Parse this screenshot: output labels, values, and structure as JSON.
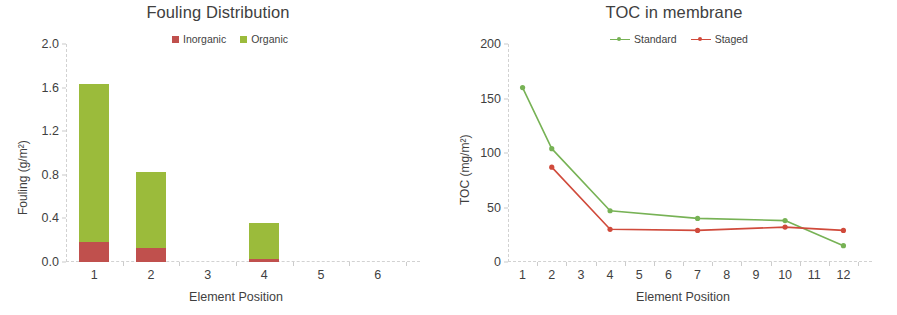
{
  "colors": {
    "inorganic": "#C0504D",
    "organic": "#9BBB3B",
    "standard": "#77B255",
    "staged": "#D04A3B",
    "axis": "#d2d2d2",
    "text": "#3f3f3f"
  },
  "charts": [
    {
      "id": "fouling-distribution",
      "chart_kind": "bar",
      "title": "Fouling Distribution",
      "legend": [
        {
          "label": "Inorganic",
          "color_key": "inorganic"
        },
        {
          "label": "Organic",
          "color_key": "organic"
        }
      ],
      "ylabel": "Fouling (g/m²)",
      "xlabel": "Element Position",
      "yticks": [
        "0.0",
        "0.4",
        "0.8",
        "1.2",
        "1.6",
        "2.0"
      ],
      "xticks": [
        "1",
        "2",
        "3",
        "4",
        "5",
        "6"
      ]
    },
    {
      "id": "toc-in-membrane",
      "chart_kind": "line",
      "title": "TOC in membrane",
      "legend": [
        {
          "label": "Standard",
          "color_key": "standard"
        },
        {
          "label": "Staged",
          "color_key": "staged"
        }
      ],
      "ylabel": "TOC (mg/m²)",
      "xlabel": "Element Position",
      "yticks": [
        "0",
        "50",
        "100",
        "150",
        "200"
      ],
      "xticks": [
        "1",
        "2",
        "3",
        "4",
        "5",
        "6",
        "7",
        "8",
        "9",
        "10",
        "11",
        "12"
      ]
    }
  ],
  "chart_data": [
    {
      "type": "bar",
      "title": "Fouling Distribution",
      "subtitle": "",
      "xlabel": "Element Position",
      "ylabel": "Fouling (g/m²)",
      "categories": [
        "1",
        "2",
        "3",
        "4",
        "5",
        "6"
      ],
      "stacked": true,
      "series": [
        {
          "name": "Inorganic",
          "color": "#C0504D",
          "values": [
            0.18,
            0.13,
            0,
            0.03,
            0,
            0
          ]
        },
        {
          "name": "Organic",
          "color": "#9BBB3B",
          "values": [
            1.45,
            0.7,
            0,
            0.33,
            0,
            0
          ]
        }
      ],
      "totals": [
        1.63,
        0.83,
        0,
        0.36,
        0,
        0
      ],
      "ylim": [
        0,
        2.0
      ],
      "ytick_values": [
        0.0,
        0.4,
        0.8,
        1.2,
        1.6,
        2.0
      ],
      "tick_labels": [
        "0.0",
        "0.4",
        "0.8",
        "1.2",
        "1.6",
        "2.0"
      ],
      "grid": false,
      "legend_position": "top-center"
    },
    {
      "type": "line",
      "title": "TOC in membrane",
      "subtitle": "",
      "xlabel": "Element Position",
      "ylabel": "TOC (mg/m²)",
      "x": [
        1,
        2,
        3,
        4,
        5,
        6,
        7,
        8,
        9,
        10,
        11,
        12
      ],
      "series": [
        {
          "name": "Standard",
          "color": "#77B255",
          "points": [
            {
              "x": 1,
              "y": 160
            },
            {
              "x": 2,
              "y": 104
            },
            {
              "x": 4,
              "y": 47
            },
            {
              "x": 7,
              "y": 40
            },
            {
              "x": 10,
              "y": 38
            },
            {
              "x": 12,
              "y": 15
            }
          ]
        },
        {
          "name": "Staged",
          "color": "#D04A3B",
          "points": [
            {
              "x": 2,
              "y": 87
            },
            {
              "x": 4,
              "y": 30
            },
            {
              "x": 7,
              "y": 29
            },
            {
              "x": 10,
              "y": 32
            },
            {
              "x": 12,
              "y": 29
            }
          ]
        }
      ],
      "ylim": [
        0,
        200
      ],
      "xlim": [
        1,
        12
      ],
      "ytick_values": [
        0,
        50,
        100,
        150,
        200
      ],
      "tick_labels": [
        "0",
        "50",
        "100",
        "150",
        "200"
      ],
      "grid": false,
      "legend_position": "top-center"
    }
  ]
}
